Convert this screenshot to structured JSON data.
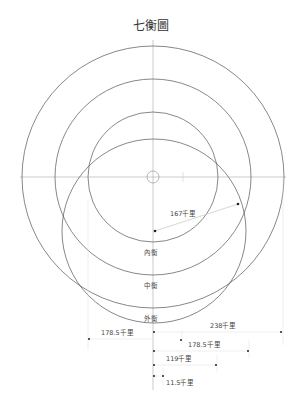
{
  "title": "七衡圖",
  "labels": {
    "inner": "內衡",
    "middle": "中衡",
    "outer": "外衡",
    "radius": "167千里"
  },
  "dimensions": [
    {
      "label": "238千里"
    },
    {
      "label": "178.5千里"
    },
    {
      "label": "178.5千里"
    },
    {
      "label": "119千里"
    },
    {
      "label": "11.5千里"
    }
  ],
  "colors": {
    "line": "#555555",
    "guide": "#bbbbbb",
    "text": "#333333"
  }
}
